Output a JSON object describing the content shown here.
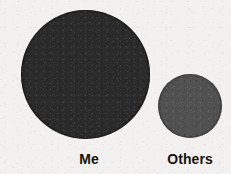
{
  "background_color": "#f3f1ef",
  "labels": {
    "me": "Me",
    "others": "Others"
  },
  "chart_data": {
    "type": "bubble",
    "title": "",
    "subtitle": "",
    "xlabel": "",
    "ylabel": "",
    "categories": [
      "Me",
      "Others"
    ],
    "values": [
      129,
      64
    ],
    "value_unit": "circle diameter (px)",
    "series": [
      {
        "name": "Proportional circles",
        "values": [
          129,
          64
        ]
      }
    ],
    "points": [
      {
        "label": "Me",
        "diameter": 129,
        "radius": 64.5,
        "center_x": 85,
        "center_y": 74,
        "area_relative": 4.06,
        "color": "#2b2a2a"
      },
      {
        "label": "Others",
        "diameter": 64,
        "radius": 32,
        "center_x": 190,
        "center_y": 106,
        "area_relative": 1.0,
        "color": "#515050"
      }
    ],
    "area_ratio": "4.06 : 1",
    "diameter_ratio": "2.02 : 1",
    "grid": false,
    "legend": "none",
    "axis_visible": false,
    "annotations": []
  },
  "colors": {
    "bubble_me": "#2b2a2a",
    "bubble_others": "#515050",
    "label_text": "#15130f",
    "paper": "#f3f1ef"
  }
}
